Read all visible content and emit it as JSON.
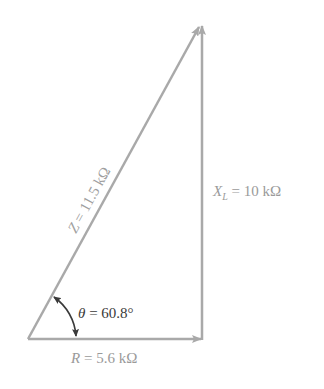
{
  "diagram": {
    "type": "impedance-triangle",
    "colors": {
      "vector": "#a9a9a9",
      "label_gray": "#9a9a9a",
      "angle_label": "#3a3a3a",
      "angle_arc": "#3a3a3a"
    },
    "labels": {
      "hypotenuse": {
        "var": "Z",
        "text": " = 11.5 kΩ"
      },
      "vertical": {
        "var": "X",
        "sub": "L",
        "text": " = 10 kΩ"
      },
      "horizontal": {
        "var": "R",
        "text": " = 5.6 kΩ"
      },
      "angle": {
        "var": "θ",
        "text": " = 60.8°"
      }
    }
  }
}
